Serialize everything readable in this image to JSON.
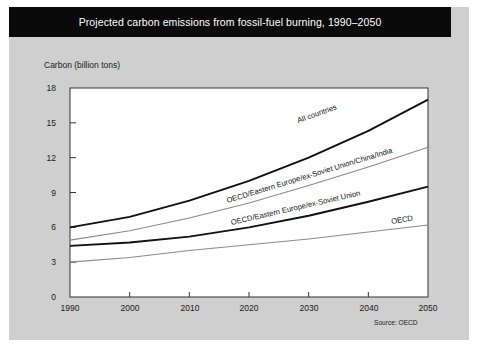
{
  "figure": {
    "title": "Projected carbon emissions from fossil-fuel burning, 1990–2050",
    "source": "Source: OECD",
    "background_color": "#cfcfcf",
    "title_bar_color": "#0a0a0a",
    "plot_background_color": "#ffffff"
  },
  "chart_data": {
    "type": "line",
    "title": "Projected carbon emissions from fossil-fuel burning, 1990–2050",
    "xlabel": "",
    "ylabel": "Carbon (billion tons)",
    "xlim": [
      1990,
      2050
    ],
    "ylim": [
      0,
      18
    ],
    "xticks": [
      1990,
      2000,
      2010,
      2020,
      2030,
      2040,
      2050
    ],
    "xtick_labels": [
      "1990",
      "2000",
      "2010",
      "2020",
      "2030",
      "2040",
      "2050"
    ],
    "yticks": [
      0,
      3,
      6,
      9,
      12,
      15,
      18
    ],
    "ytick_labels": [
      "0",
      "3",
      "6",
      "9",
      "12",
      "15",
      "18"
    ],
    "grid": false,
    "legend": "inline-labels",
    "x": [
      1990,
      2000,
      2010,
      2020,
      2030,
      2040,
      2050
    ],
    "series": [
      {
        "name": "All countries",
        "label": "All countries",
        "color": "#111111",
        "width": 1.9,
        "values": [
          6.0,
          6.9,
          8.3,
          10.0,
          12.0,
          14.3,
          17.0
        ]
      },
      {
        "name": "OECD/Eastern Europe/ex-Soviet Union/China/India",
        "label": "OECD/Eastern Europe/ex-Soviet Union/China/India",
        "color": "#8a8a8a",
        "width": 1.1,
        "values": [
          4.9,
          5.7,
          6.8,
          8.1,
          9.6,
          11.2,
          12.9
        ]
      },
      {
        "name": "OECD/Eastern Europe/ex-Soviet Union",
        "label": "OECD/Eastern Europe/ex-Soviet Union",
        "color": "#111111",
        "width": 1.9,
        "values": [
          4.4,
          4.7,
          5.2,
          6.0,
          7.0,
          8.2,
          9.5
        ]
      },
      {
        "name": "OECD",
        "label": "OECD",
        "color": "#8a8a8a",
        "width": 1.1,
        "values": [
          3.0,
          3.4,
          4.0,
          4.5,
          5.0,
          5.6,
          6.2
        ]
      }
    ]
  },
  "labels": {
    "all_countries": "All countries",
    "oecd_ee_su_china_india": "OECD/Eastern Europe/ex-Soviet Union/China/India",
    "oecd_ee_su": "OECD/Eastern Europe/ex-Soviet Union",
    "oecd": "OECD"
  }
}
